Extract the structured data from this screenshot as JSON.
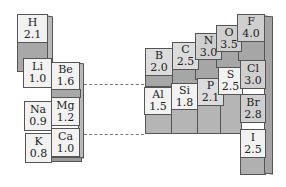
{
  "colors": {
    "face_light": "#f2f2f2",
    "face_dark": "#cfcfcf",
    "side": "#b9b9b9",
    "outline": "#555555"
  },
  "left_group": [
    {
      "symbol": "H",
      "value": "2.1"
    },
    {
      "symbol": "Li",
      "value": "1.0"
    },
    {
      "symbol": "Be",
      "value": "1.6"
    },
    {
      "symbol": "Na",
      "value": "0.9"
    },
    {
      "symbol": "Mg",
      "value": "1.2"
    },
    {
      "symbol": "K",
      "value": "0.8"
    },
    {
      "symbol": "Ca",
      "value": "1.0"
    }
  ],
  "right_group": [
    {
      "symbol": "B",
      "value": "2.0"
    },
    {
      "symbol": "C",
      "value": "2.5"
    },
    {
      "symbol": "N",
      "value": "3.0"
    },
    {
      "symbol": "O",
      "value": "3.5"
    },
    {
      "symbol": "F",
      "value": "4.0"
    },
    {
      "symbol": "Al",
      "value": "1.5"
    },
    {
      "symbol": "Si",
      "value": "1.8"
    },
    {
      "symbol": "P",
      "value": "2.1"
    },
    {
      "symbol": "S",
      "value": "2.5"
    },
    {
      "symbol": "Cl",
      "value": "3.0"
    },
    {
      "symbol": "Br",
      "value": "2.8"
    },
    {
      "symbol": "I",
      "value": "2.5"
    }
  ]
}
